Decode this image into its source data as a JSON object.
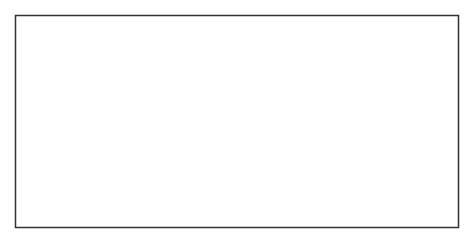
{
  "diagram": {
    "labels": {
      "through": "One signal allowed through",
      "mediated_left": "mediated signals",
      "mediated_right": "mediated signals",
      "unit": "fan-out unit",
      "coax": "coax"
    },
    "colors": {
      "frame": "#333333",
      "unit_fill": "#e4e4e4",
      "coax_fill": "#b9b9b9",
      "ink": "#111111"
    }
  }
}
